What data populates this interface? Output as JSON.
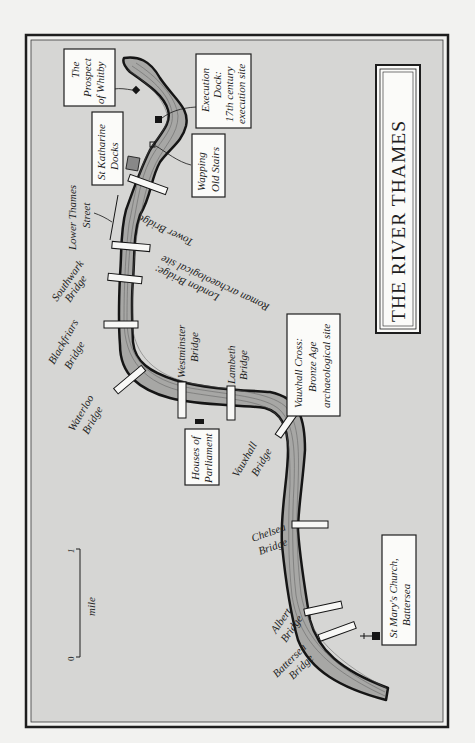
{
  "map": {
    "title": "THE RIVER THAMES",
    "colors": {
      "page_bg": "#f2f2f0",
      "map_bg": "#d6d6d4",
      "frame": "#1e1e1e",
      "river_fill": "#a7a7a5",
      "river_bank": "#151515",
      "river_lines": "#5a5a5a",
      "bridge": "#f8f8f6",
      "box_fill": "#fbfbf9",
      "text": "#1e1e1e"
    },
    "scale_bar": {
      "start": "0",
      "end": "1",
      "unit": "mile"
    },
    "bridges": [
      {
        "id": "tower",
        "lines": [
          "Tower Bridge"
        ]
      },
      {
        "id": "london",
        "lines": [
          "London Bridge:",
          "Roman archaeological site"
        ]
      },
      {
        "id": "southwark",
        "lines": [
          "Southwark",
          "Bridge"
        ]
      },
      {
        "id": "blackfriars",
        "lines": [
          "Blackfriars",
          "Bridge"
        ]
      },
      {
        "id": "waterloo",
        "lines": [
          "Waterloo",
          "Bridge"
        ]
      },
      {
        "id": "westminster",
        "lines": [
          "Westminster",
          "Bridge"
        ]
      },
      {
        "id": "lambeth",
        "lines": [
          "Lambeth",
          "Bridge"
        ]
      },
      {
        "id": "vauxhall",
        "lines": [
          "Vauxhall",
          "Bridge"
        ]
      },
      {
        "id": "chelsea",
        "lines": [
          "Chelsea",
          "Bridge"
        ]
      },
      {
        "id": "albert",
        "lines": [
          "Albert",
          "Bridge"
        ]
      },
      {
        "id": "battersea",
        "lines": [
          "Battersea",
          "Bridge"
        ]
      }
    ],
    "landmarks": [
      {
        "id": "prospect-of-whitby",
        "lines": [
          "The",
          "Prospect",
          "of Whitby"
        ]
      },
      {
        "id": "execution-dock",
        "lines": [
          "Execution",
          "Dock:",
          "17th century",
          "execution site"
        ]
      },
      {
        "id": "st-katharine-docks",
        "lines": [
          "St Katharine",
          "Docks"
        ]
      },
      {
        "id": "wapping-old-stairs",
        "lines": [
          "Wapping",
          "Old Stairs"
        ]
      },
      {
        "id": "lower-thames-street",
        "lines": [
          "Lower Thames",
          "Street"
        ]
      },
      {
        "id": "houses-of-parliament",
        "lines": [
          "Houses of",
          "Parliament"
        ]
      },
      {
        "id": "vauxhall-cross",
        "lines": [
          "Vauxhall Cross:",
          "Bronze Age",
          "archaeological site"
        ]
      },
      {
        "id": "st-marys-church",
        "lines": [
          "St Mary's Church,",
          "Battersea"
        ]
      }
    ]
  }
}
